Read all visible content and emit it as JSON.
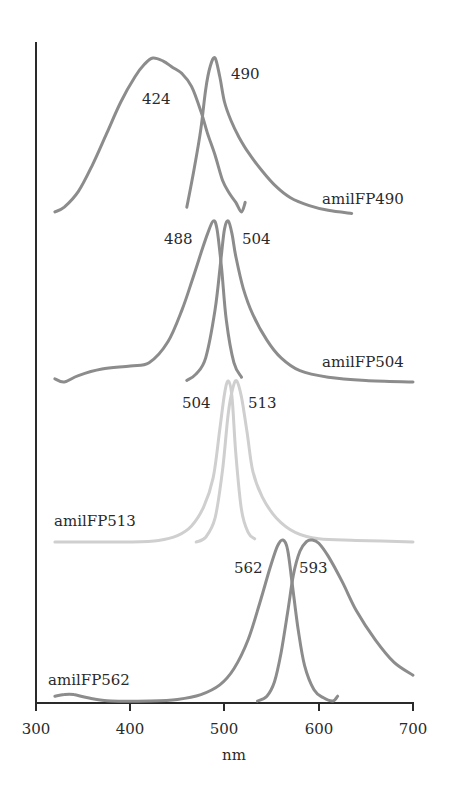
{
  "chart_data": {
    "type": "line",
    "title": "",
    "xlabel": "nm",
    "ylabel": "",
    "xlim": [
      300,
      700
    ],
    "xticks": [
      300,
      400,
      500,
      600,
      700
    ],
    "grid": false,
    "legend_position": "inline labels",
    "panels": [
      {
        "name": "amilFP490",
        "color": "#8c8c8c",
        "excitation_peak_nm": 424,
        "emission_peak_nm": 490,
        "peak_labels": [
          "424",
          "490"
        ],
        "excitation": {
          "x": [
            320,
            330,
            345,
            360,
            375,
            390,
            405,
            415,
            424,
            435,
            445,
            455,
            465,
            475,
            482,
            490,
            498,
            505,
            512,
            518,
            522
          ],
          "y": [
            0.02,
            0.05,
            0.15,
            0.32,
            0.52,
            0.72,
            0.88,
            0.96,
            1.0,
            0.98,
            0.94,
            0.9,
            0.82,
            0.66,
            0.52,
            0.38,
            0.22,
            0.14,
            0.08,
            0.02,
            0.08
          ]
        },
        "emission": {
          "x": [
            460,
            468,
            475,
            480,
            485,
            490,
            495,
            500,
            507,
            515,
            525,
            540,
            555,
            570,
            590,
            610,
            635
          ],
          "y": [
            0.05,
            0.3,
            0.55,
            0.8,
            0.95,
            1.0,
            0.88,
            0.72,
            0.6,
            0.5,
            0.4,
            0.28,
            0.18,
            0.11,
            0.06,
            0.03,
            0.01
          ]
        }
      },
      {
        "name": "amilFP504",
        "color": "#8c8c8c",
        "excitation_peak_nm": 488,
        "emission_peak_nm": 504,
        "peak_labels": [
          "488",
          "504"
        ],
        "excitation": {
          "x": [
            320,
            330,
            345,
            370,
            400,
            420,
            440,
            455,
            465,
            475,
            482,
            488,
            492,
            497,
            502,
            510,
            518
          ],
          "y": [
            0.02,
            0.0,
            0.04,
            0.08,
            0.1,
            0.12,
            0.25,
            0.45,
            0.62,
            0.8,
            0.92,
            1.0,
            0.95,
            0.7,
            0.38,
            0.12,
            0.03
          ]
        },
        "emission": {
          "x": [
            460,
            470,
            480,
            490,
            496,
            500,
            504,
            508,
            512,
            520,
            530,
            545,
            560,
            580,
            610,
            650,
            700
          ],
          "y": [
            0.01,
            0.05,
            0.15,
            0.45,
            0.75,
            0.95,
            1.0,
            0.92,
            0.78,
            0.58,
            0.42,
            0.26,
            0.15,
            0.07,
            0.03,
            0.01,
            0.0
          ]
        }
      },
      {
        "name": "amilFP513",
        "color": "#cfcfcf",
        "excitation_peak_nm": 504,
        "emission_peak_nm": 513,
        "peak_labels": [
          "504",
          "513"
        ],
        "excitation": {
          "x": [
            320,
            360,
            400,
            430,
            450,
            465,
            478,
            488,
            495,
            500,
            504,
            508,
            512,
            518,
            525,
            532
          ],
          "y": [
            0.0,
            0.0,
            0.0,
            0.01,
            0.04,
            0.1,
            0.22,
            0.4,
            0.7,
            0.92,
            1.0,
            0.9,
            0.55,
            0.2,
            0.06,
            0.02
          ]
        },
        "emission": {
          "x": [
            470,
            480,
            490,
            498,
            504,
            509,
            513,
            518,
            524,
            530,
            540,
            555,
            575,
            600,
            640,
            700
          ],
          "y": [
            0.0,
            0.03,
            0.15,
            0.45,
            0.8,
            0.96,
            1.0,
            0.9,
            0.68,
            0.44,
            0.28,
            0.15,
            0.06,
            0.02,
            0.01,
            0.0
          ]
        }
      },
      {
        "name": "amilFP562",
        "color": "#8c8c8c",
        "excitation_peak_nm": 562,
        "emission_peak_nm": 593,
        "peak_labels": [
          "562",
          "593"
        ],
        "excitation": {
          "x": [
            320,
            330,
            340,
            355,
            380,
            420,
            450,
            475,
            495,
            510,
            525,
            538,
            548,
            556,
            562,
            567,
            572,
            578,
            585,
            595,
            605,
            615,
            620
          ],
          "y": [
            0.03,
            0.04,
            0.04,
            0.02,
            0.0,
            0.0,
            0.01,
            0.04,
            0.1,
            0.2,
            0.38,
            0.62,
            0.82,
            0.96,
            1.0,
            0.94,
            0.72,
            0.45,
            0.22,
            0.07,
            0.02,
            0.0,
            0.03
          ]
        },
        "emission": {
          "x": [
            535,
            545,
            553,
            560,
            567,
            573,
            580,
            587,
            593,
            600,
            610,
            625,
            640,
            660,
            680,
            700
          ],
          "y": [
            0.0,
            0.03,
            0.12,
            0.3,
            0.55,
            0.78,
            0.93,
            0.99,
            1.0,
            0.98,
            0.9,
            0.74,
            0.56,
            0.38,
            0.24,
            0.16
          ]
        }
      }
    ]
  },
  "labels": {
    "xlabel": "nm",
    "ticks": [
      "300",
      "400",
      "500",
      "600",
      "700"
    ],
    "series": [
      "amilFP490",
      "amilFP504",
      "amilFP513",
      "amilFP562"
    ],
    "p490": [
      "424",
      "490"
    ],
    "p504": [
      "488",
      "504"
    ],
    "p513": [
      "504",
      "513"
    ],
    "p562": [
      "562",
      "593"
    ]
  }
}
